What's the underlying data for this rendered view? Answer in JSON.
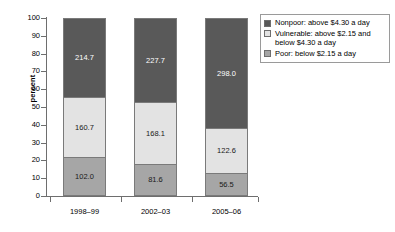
{
  "chart_data": {
    "type": "bar",
    "title": "",
    "subtitle": "",
    "xlabel": "",
    "ylabel": "percent",
    "ylim": [
      0,
      100
    ],
    "yticks": [
      0,
      10,
      20,
      30,
      40,
      50,
      60,
      70,
      80,
      90,
      100
    ],
    "ytick_labels": [
      "0",
      "10",
      "20",
      "30",
      "40",
      "50",
      "60",
      "70",
      "80",
      "90",
      "100"
    ],
    "grid": false,
    "stacked": true,
    "stack_mode": "percent",
    "legend_position": "right",
    "categories": [
      "1998–99",
      "2002–03",
      "2005–06"
    ],
    "series": [
      {
        "name": "Nonpoor: above $4.30 a day",
        "color": "#595959",
        "label_color": "#ffffff",
        "values": [
          214.7,
          227.7,
          298.0
        ],
        "value_labels": [
          "214.7",
          "227.7",
          "298.0"
        ],
        "percents": [
          44.9,
          47.7,
          62.4
        ]
      },
      {
        "name": "Vulnerable: above $2.15 and below $4.30 a day",
        "color": "#e3e3e3",
        "label_color": "#1a1a1a",
        "values": [
          160.7,
          168.1,
          122.6
        ],
        "value_labels": [
          "160.7",
          "168.1",
          "122.6"
        ],
        "percents": [
          33.6,
          35.2,
          25.7
        ]
      },
      {
        "name": "Poor: below $2.15 a day",
        "color": "#a6a6a6",
        "label_color": "#1a1a1a",
        "values": [
          102.0,
          81.6,
          56.5
        ],
        "value_labels": [
          "102.0",
          "81.6",
          "56.5"
        ],
        "percents": [
          21.5,
          17.1,
          11.9
        ]
      }
    ]
  },
  "legend": {
    "items": [
      {
        "label": "Nonpoor: above $4.30 a day",
        "color": "#595959"
      },
      {
        "label": "Vulnerable: above $2.15 and below $4.30 a day",
        "color": "#e3e3e3"
      },
      {
        "label": "Poor: below $2.15 a day",
        "color": "#a6a6a6"
      }
    ]
  }
}
